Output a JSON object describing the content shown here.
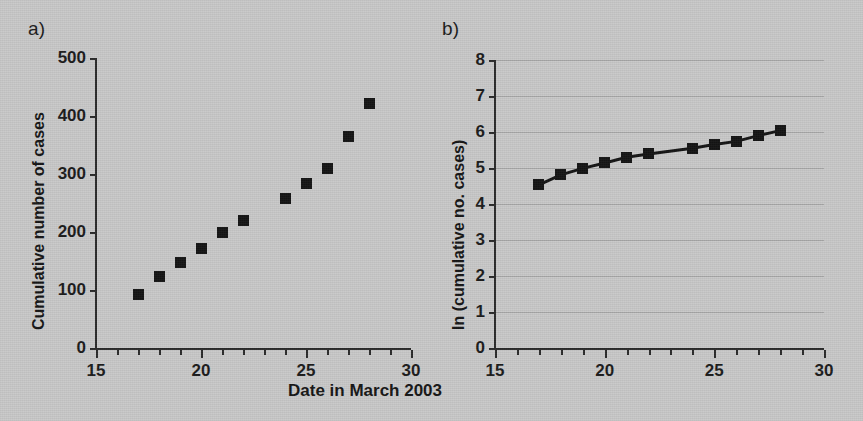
{
  "figure": {
    "background_color": "#c9c9c9",
    "ink_color": "#141414",
    "gridline_color": "#a9a9a9",
    "shared_xlabel": "Date in March 2003"
  },
  "panels": [
    {
      "letter": "a)",
      "name": "cumulative-cases-panel"
    },
    {
      "letter": "b)",
      "name": "log-cumulative-cases-panel"
    }
  ],
  "chart_data": [
    {
      "type": "scatter",
      "panel": "a)",
      "title": "",
      "xlabel": "Date in March 2003",
      "ylabel": "Cumulative number of cases",
      "xlim": [
        15,
        30
      ],
      "ylim": [
        0,
        500
      ],
      "xticks": [
        15,
        20,
        25,
        30
      ],
      "xtick_labels": [
        "15",
        "20",
        "25",
        "30"
      ],
      "xminor_tick_interval": 1,
      "yticks": [
        0,
        100,
        200,
        300,
        400,
        500
      ],
      "ytick_labels": [
        "0",
        "100",
        "200",
        "300",
        "400",
        "500"
      ],
      "grid": false,
      "legend": "none",
      "marker": "filled-square",
      "x": [
        17,
        18,
        19,
        20,
        21,
        22,
        24,
        25,
        26,
        27,
        28
      ],
      "values": [
        93,
        123,
        147,
        171,
        200,
        219,
        257,
        283,
        310,
        364,
        421
      ],
      "notes": "No data point plotted for 23 March"
    },
    {
      "type": "line",
      "panel": "b)",
      "title": "",
      "xlabel": "Date in March 2003",
      "ylabel": "ln (cumulative no. cases)",
      "xlim": [
        15,
        30
      ],
      "ylim": [
        0,
        8
      ],
      "xticks": [
        15,
        20,
        25,
        30
      ],
      "xtick_labels": [
        "15",
        "20",
        "25",
        "30"
      ],
      "xminor_tick_interval": 1,
      "yticks": [
        0,
        1,
        2,
        3,
        4,
        5,
        6,
        7,
        8
      ],
      "ytick_labels": [
        "0",
        "1",
        "2",
        "3",
        "4",
        "5",
        "6",
        "7",
        "8"
      ],
      "grid": true,
      "legend": "none",
      "marker": "filled-square",
      "x": [
        17,
        18,
        19,
        20,
        21,
        22,
        24,
        25,
        26,
        27,
        28
      ],
      "values": [
        4.53,
        4.81,
        4.99,
        5.14,
        5.3,
        5.39,
        5.55,
        5.65,
        5.74,
        5.9,
        6.04
      ],
      "notes": "Markers connected by a solid black line; no data point for 23 March"
    }
  ]
}
